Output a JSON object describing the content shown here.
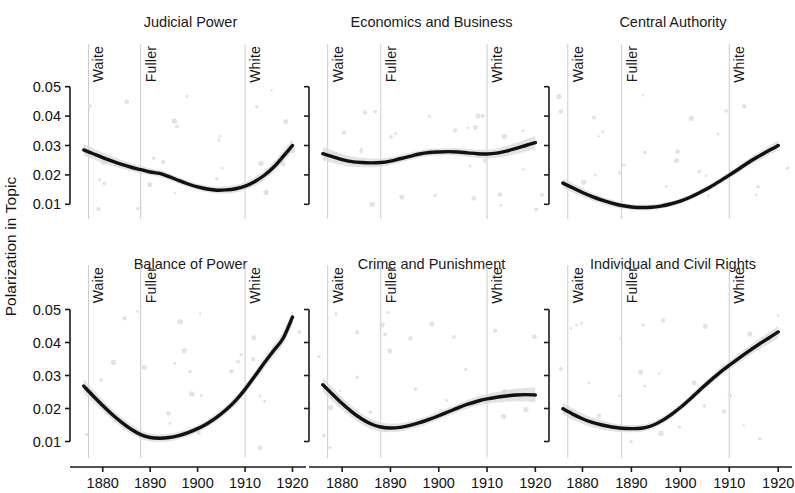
{
  "figure": {
    "width": 795,
    "height": 493,
    "background": "#ffffff",
    "y_axis_title": "Polarization in Topic",
    "line_color": "#111111",
    "ribbon_color": "#d9d9d9",
    "vline_color": "#cccccc",
    "axis_color": "#1a1a1a"
  },
  "chart_data": {
    "type": "line",
    "title": "",
    "xlabel": "",
    "ylabel": "Polarization in Topic",
    "xlim": [
      1875,
      1922
    ],
    "ylim": [
      0.005,
      0.055
    ],
    "xticks": [
      1880,
      1890,
      1900,
      1910,
      1920
    ],
    "yticks": [
      0.01,
      0.02,
      0.03,
      0.04,
      0.05
    ],
    "ytick_labels": [
      "0.01",
      "0.02",
      "0.03",
      "0.04",
      "0.05"
    ],
    "xtick_labels": [
      "1880",
      "1890",
      "1900",
      "1910",
      "1920"
    ],
    "grid": false,
    "legend": "none",
    "annotations": [
      {
        "label": "Waite",
        "x": 1877
      },
      {
        "label": "Fuller",
        "x": 1888
      },
      {
        "label": "White",
        "x": 1910
      }
    ],
    "panels": [
      {
        "title": "Judicial Power",
        "row": 0,
        "col": 0,
        "x": [
          1876,
          1878,
          1880,
          1882,
          1884,
          1886,
          1888,
          1890,
          1892,
          1894,
          1896,
          1898,
          1900,
          1902,
          1904,
          1906,
          1908,
          1910,
          1912,
          1914,
          1916,
          1918,
          1920
        ],
        "y": [
          0.0285,
          0.0272,
          0.0259,
          0.0247,
          0.0236,
          0.0226,
          0.0218,
          0.021,
          0.0205,
          0.0194,
          0.0181,
          0.0169,
          0.0159,
          0.0152,
          0.0148,
          0.0149,
          0.0153,
          0.0162,
          0.0177,
          0.0198,
          0.0226,
          0.0262,
          0.03
        ],
        "band": 0.0022
      },
      {
        "title": "Economics and Business",
        "row": 0,
        "col": 1,
        "x": [
          1876,
          1878,
          1880,
          1882,
          1884,
          1886,
          1888,
          1890,
          1892,
          1894,
          1896,
          1898,
          1900,
          1902,
          1904,
          1906,
          1908,
          1910,
          1912,
          1914,
          1916,
          1918,
          1920
        ],
        "y": [
          0.0272,
          0.0262,
          0.0252,
          0.0245,
          0.0242,
          0.0241,
          0.0242,
          0.0247,
          0.0255,
          0.0263,
          0.0271,
          0.0276,
          0.0278,
          0.0279,
          0.0278,
          0.0275,
          0.0272,
          0.0271,
          0.0274,
          0.0281,
          0.029,
          0.03,
          0.031
        ],
        "band": 0.0024
      },
      {
        "title": "Central Authority",
        "row": 0,
        "col": 2,
        "x": [
          1876,
          1878,
          1880,
          1882,
          1884,
          1886,
          1888,
          1890,
          1892,
          1894,
          1896,
          1898,
          1900,
          1902,
          1904,
          1906,
          1908,
          1910,
          1912,
          1914,
          1916,
          1918,
          1920
        ],
        "y": [
          0.0172,
          0.0156,
          0.014,
          0.0126,
          0.0114,
          0.0104,
          0.0096,
          0.0091,
          0.0089,
          0.009,
          0.0094,
          0.0101,
          0.0111,
          0.0124,
          0.014,
          0.0158,
          0.0178,
          0.0199,
          0.0221,
          0.0243,
          0.0263,
          0.0282,
          0.03
        ],
        "band": 0.0018
      },
      {
        "title": "Balance of Power",
        "row": 1,
        "col": 0,
        "x": [
          1876,
          1878,
          1880,
          1882,
          1884,
          1886,
          1888,
          1890,
          1892,
          1894,
          1896,
          1898,
          1900,
          1902,
          1904,
          1906,
          1908,
          1910,
          1912,
          1914,
          1916,
          1918,
          1920
        ],
        "y": [
          0.0268,
          0.0238,
          0.0209,
          0.0182,
          0.0158,
          0.0137,
          0.0121,
          0.0112,
          0.011,
          0.0112,
          0.0118,
          0.0127,
          0.0139,
          0.0154,
          0.0173,
          0.0196,
          0.0224,
          0.0258,
          0.0297,
          0.0337,
          0.0375,
          0.0412,
          0.0477
        ],
        "band": 0.0022
      },
      {
        "title": "Crime and Punishment",
        "row": 1,
        "col": 1,
        "x": [
          1876,
          1878,
          1880,
          1882,
          1884,
          1886,
          1888,
          1890,
          1892,
          1894,
          1896,
          1898,
          1900,
          1902,
          1904,
          1906,
          1908,
          1910,
          1912,
          1914,
          1916,
          1918,
          1920
        ],
        "y": [
          0.0272,
          0.0243,
          0.0215,
          0.019,
          0.0169,
          0.0153,
          0.0144,
          0.0141,
          0.0143,
          0.0149,
          0.0157,
          0.0167,
          0.0178,
          0.019,
          0.0202,
          0.0213,
          0.0222,
          0.0229,
          0.0234,
          0.0238,
          0.0241,
          0.0242,
          0.0241
        ],
        "band": 0.0024
      },
      {
        "title": "Individual and Civil Rights",
        "row": 1,
        "col": 2,
        "x": [
          1876,
          1878,
          1880,
          1882,
          1884,
          1886,
          1888,
          1890,
          1892,
          1894,
          1896,
          1898,
          1900,
          1902,
          1904,
          1906,
          1908,
          1910,
          1912,
          1914,
          1916,
          1918,
          1920
        ],
        "y": [
          0.0199,
          0.0183,
          0.0169,
          0.0158,
          0.015,
          0.0144,
          0.014,
          0.0139,
          0.014,
          0.0147,
          0.0161,
          0.018,
          0.0203,
          0.0229,
          0.0256,
          0.0283,
          0.0308,
          0.0331,
          0.0353,
          0.0374,
          0.0394,
          0.0413,
          0.0432
        ],
        "band": 0.002
      }
    ]
  }
}
